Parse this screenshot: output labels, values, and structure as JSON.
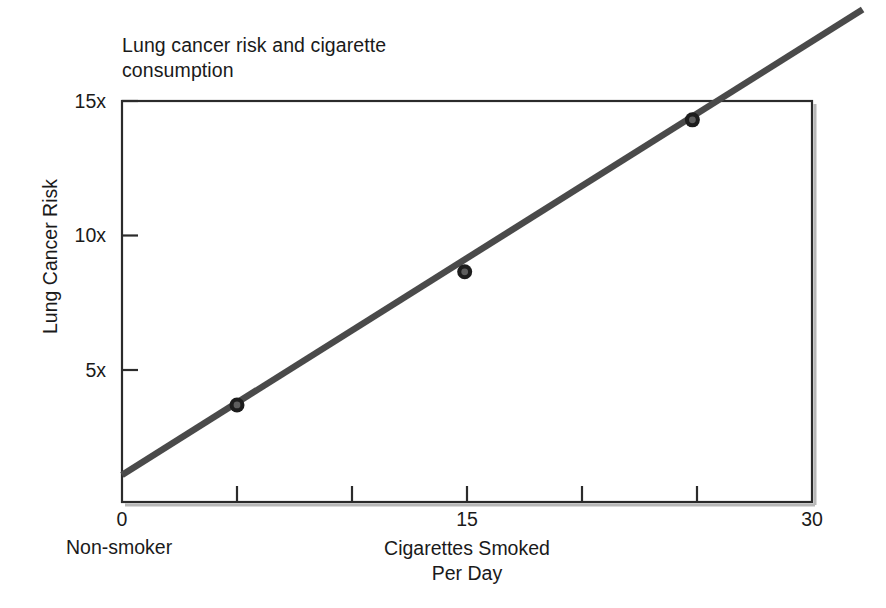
{
  "chart_data": {
    "type": "line",
    "title": "Lung cancer risk and cigarette consumption",
    "title_line1": "Lung cancer risk and cigarette",
    "title_line2": "consumption",
    "xlabel": "Cigarettes Smoked Per Day",
    "xlabel_line1": "Cigarettes Smoked",
    "xlabel_line2": "Per Day",
    "ylabel": "Lung Cancer Risk",
    "xlim": [
      0,
      30
    ],
    "ylim": [
      0,
      15
    ],
    "grid": false,
    "legend": false,
    "x_origin_annotation": "Non-smoker",
    "xticks": [
      0,
      5,
      10,
      15,
      20,
      25,
      30
    ],
    "xtick_labels": [
      "0",
      "",
      "",
      "15",
      "",
      "",
      "30"
    ],
    "yticks": [
      5,
      10,
      15
    ],
    "ytick_labels": [
      "5x",
      "10x",
      "15x"
    ],
    "line_color": "#4a4a4a",
    "axis_color": "#2b2b2b",
    "marker_color": "#222222",
    "series": [
      {
        "name": "Lung cancer risk",
        "trend_start": {
          "x": 0,
          "y": 1.1
        },
        "trend_end": {
          "x": 32.2,
          "y": 18.4
        },
        "points": [
          {
            "x": 5,
            "y": 3.7
          },
          {
            "x": 14.9,
            "y": 8.65
          },
          {
            "x": 24.8,
            "y": 14.3
          }
        ]
      }
    ]
  }
}
